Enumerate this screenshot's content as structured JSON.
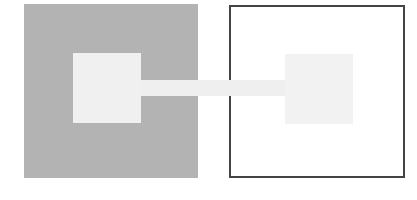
{
  "diagram": {
    "left_container": {
      "fill": "#b3b3b3",
      "style": "filled"
    },
    "right_container": {
      "fill": "#ffffff",
      "border": "#444444",
      "style": "outlined"
    },
    "left_inner": {
      "fill": "#f0f0f0"
    },
    "right_inner": {
      "fill": "#f2f2f2"
    },
    "connector": {
      "fill": "#efefef"
    }
  }
}
